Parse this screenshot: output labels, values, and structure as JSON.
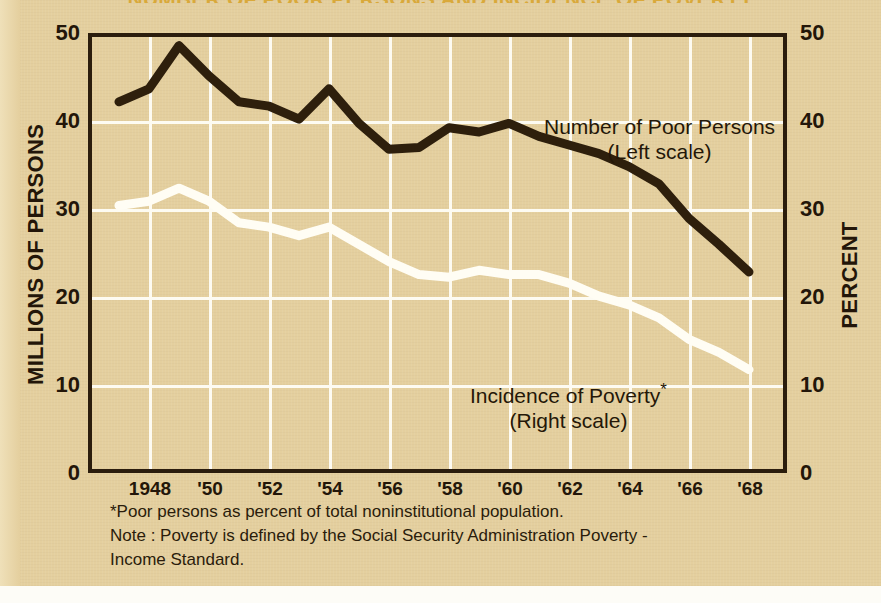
{
  "title": "NUMBER OF POOR PERSONS AND INCIDENCE OF POVERTY",
  "axes": {
    "left_title": "MILLIONS OF PERSONS",
    "right_title": "PERCENT",
    "left_ticks": [
      "50",
      "40",
      "30",
      "20",
      "10",
      "0"
    ],
    "right_ticks": [
      "50",
      "40",
      "30",
      "20",
      "10",
      "0"
    ],
    "x_ticks": [
      "1948",
      "'50",
      "'52",
      "'54",
      "'56",
      "'58",
      "'60",
      "'62",
      "'64",
      "'66",
      "'68"
    ]
  },
  "annotations": {
    "dark_line_1": "Number of Poor Persons",
    "dark_line_2": "(Left scale)",
    "light_line_1": "Incidence of Poverty",
    "light_line_1_star": "*",
    "light_line_2": "(Right scale)"
  },
  "footnotes": {
    "line1": "*Poor persons as percent of total noninstitutional population.",
    "line2": "Note : Poverty is defined by the Social Security Administration Poverty -",
    "line3": "Income Standard."
  },
  "colors": {
    "paper": "#e4cf9e",
    "frame": "#2b1d0d",
    "grid": "#fdfbf2",
    "dark_series": "#2e1f0c",
    "light_series": "#fffdf4",
    "title": "#d9a93b",
    "text": "#231609"
  },
  "chart_data": {
    "type": "line",
    "title": "NUMBER OF POOR PERSONS AND INCIDENCE OF POVERTY",
    "xlabel": "",
    "ylabel": "MILLIONS OF PERSONS",
    "y2label": "PERCENT",
    "xlim": [
      1947,
      1969
    ],
    "ylim": [
      0,
      50
    ],
    "y2lim": [
      0,
      50
    ],
    "grid": true,
    "legend": "in-plot annotations",
    "x": [
      1947,
      1948,
      1949,
      1950,
      1951,
      1952,
      1953,
      1954,
      1955,
      1956,
      1957,
      1958,
      1959,
      1960,
      1961,
      1962,
      1963,
      1964,
      1965,
      1966,
      1967,
      1968
    ],
    "series": [
      {
        "name": "Number of Poor Persons",
        "scale": "left",
        "units": "millions",
        "color": "#2e1f0c",
        "values": [
          42.5,
          44.0,
          49.0,
          45.5,
          42.5,
          42.0,
          40.5,
          44.0,
          40.0,
          37.0,
          37.2,
          39.5,
          39.0,
          40.0,
          38.5,
          37.5,
          36.5,
          35.0,
          33.0,
          29.0,
          26.0,
          22.8
        ]
      },
      {
        "name": "Incidence of Poverty",
        "scale": "right",
        "units": "percent",
        "color": "#fffdf4",
        "values": [
          30.5,
          31.0,
          32.5,
          31.0,
          28.5,
          28.0,
          27.0,
          28.0,
          26.0,
          24.0,
          22.5,
          22.2,
          23.0,
          22.5,
          22.5,
          21.5,
          20.0,
          19.0,
          17.5,
          15.0,
          13.5,
          11.5
        ]
      }
    ]
  }
}
